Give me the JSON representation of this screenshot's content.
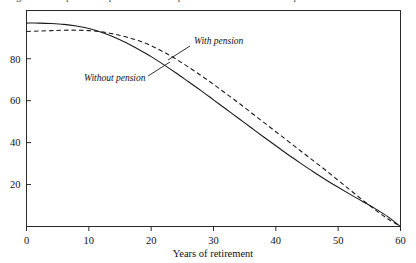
{
  "figure": {
    "caption_fragment": "Figure 1. Comparison of pension and non-pension retirement wealth depletion"
  },
  "chart_data": {
    "type": "line",
    "title": "",
    "subtitle": "",
    "xlabel": "Years of retirement",
    "ylabel": "",
    "xlim": [
      0,
      60
    ],
    "ylim": [
      0,
      103
    ],
    "xticks": [
      0,
      10,
      20,
      30,
      40,
      50,
      60
    ],
    "xticklabels": [
      "0",
      "10",
      "20",
      "30",
      "40",
      "50",
      "60"
    ],
    "yticks": [
      20,
      40,
      60,
      80
    ],
    "yticklabels": [
      "20",
      "40",
      "60",
      "80"
    ],
    "grid": false,
    "legend_position": "inline-annotations",
    "frame": "box",
    "series": [
      {
        "name": "Without pension",
        "style": "solid",
        "color": "#1a1a1a",
        "annotation": "Without pension",
        "x": [
          0,
          2,
          4,
          6,
          8,
          10,
          12,
          14,
          16,
          18,
          20,
          22,
          24,
          26,
          28,
          30,
          32,
          34,
          36,
          38,
          40,
          42,
          44,
          46,
          48,
          50,
          52,
          54,
          56,
          58,
          60
        ],
        "values": [
          97,
          97,
          96.8,
          96.4,
          95.6,
          94.4,
          92.6,
          90.4,
          87.6,
          84.4,
          81,
          77.2,
          73.2,
          69,
          64.8,
          60.4,
          56,
          51.6,
          47.2,
          42.8,
          38.5,
          34.2,
          30.1,
          26.1,
          22.3,
          18.7,
          15.2,
          11.8,
          8.4,
          4.6,
          0
        ]
      },
      {
        "name": "With pension",
        "style": "dashed",
        "color": "#1a1a1a",
        "annotation": "With pension",
        "x": [
          0,
          2,
          4,
          6,
          8,
          10,
          12,
          14,
          16,
          18,
          20,
          22,
          24,
          26,
          28,
          30,
          32,
          34,
          36,
          38,
          40,
          42,
          44,
          46,
          48,
          50,
          52,
          54,
          56,
          58,
          60
        ],
        "values": [
          93,
          93.2,
          93.4,
          93.6,
          93.6,
          93.4,
          92.8,
          91.8,
          90.4,
          88.6,
          86.2,
          83.2,
          79.8,
          76,
          72,
          67.8,
          63.4,
          59,
          54.4,
          49.8,
          45.2,
          40.6,
          36,
          31.4,
          26.8,
          22,
          17.2,
          12.4,
          7.8,
          3.6,
          0
        ]
      }
    ],
    "annotations": [
      {
        "text": "With pension",
        "x_px": 196,
        "y_px": 44,
        "leader": true
      },
      {
        "text": "Without pension",
        "x_px": 86,
        "y_px": 78,
        "leader": true
      }
    ]
  }
}
